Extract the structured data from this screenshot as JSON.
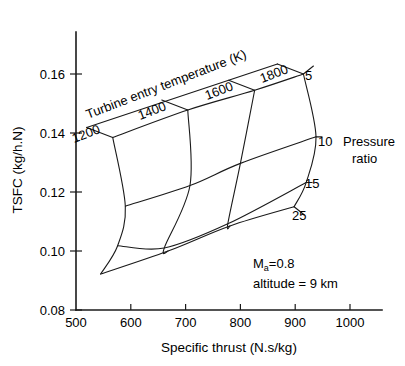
{
  "chart_data": {
    "type": "line",
    "title": "",
    "subtitle": "",
    "xlabel": "Specific thrust (N.s/kg)",
    "ylabel": "TSFC (kg/h.N)",
    "xlim": [
      500,
      1000
    ],
    "ylim": [
      0.08,
      0.16
    ],
    "xticks": [
      500,
      600,
      700,
      800,
      900,
      1000
    ],
    "xticklabels": [
      "500",
      "600",
      "700",
      "800",
      "900",
      "1000"
    ],
    "yticks": [
      0.08,
      0.1,
      0.12,
      0.14,
      0.16
    ],
    "yticklabels": [
      "0.08",
      "0.10",
      "0.12",
      "0.14",
      "0.16"
    ],
    "grid": false,
    "legend_position": "right",
    "carpet": {
      "param_u_name": "Turbine entry temperature (K)",
      "param_u_values": [
        1200,
        1400,
        1600,
        1800
      ],
      "param_u_labels": [
        "1200",
        "1400",
        "1600",
        "1800"
      ],
      "param_v_name": "Pressure ratio",
      "param_v_values": [
        5,
        10,
        15,
        25
      ],
      "param_v_labels": [
        "5",
        "10",
        "15",
        "25"
      ],
      "points": [
        {
          "tet": 1200,
          "pr": 5,
          "x": 567,
          "y": 0.1385
        },
        {
          "tet": 1400,
          "pr": 5,
          "x": 704,
          "y": 0.1478
        },
        {
          "tet": 1600,
          "pr": 5,
          "x": 826,
          "y": 0.1545
        },
        {
          "tet": 1800,
          "pr": 5,
          "x": 915,
          "y": 0.16
        },
        {
          "tet": 1200,
          "pr": 10,
          "x": 590,
          "y": 0.1152
        },
        {
          "tet": 1400,
          "pr": 10,
          "x": 708,
          "y": 0.1222
        },
        {
          "tet": 1600,
          "pr": 10,
          "x": 800,
          "y": 0.1297
        },
        {
          "tet": 1800,
          "pr": 10,
          "x": 938,
          "y": 0.1387
        },
        {
          "tet": 1200,
          "pr": 15,
          "x": 576,
          "y": 0.1018
        },
        {
          "tet": 1400,
          "pr": 15,
          "x": 661,
          "y": 0.101
        },
        {
          "tet": 1600,
          "pr": 15,
          "x": 777,
          "y": 0.1092
        },
        {
          "tet": 1800,
          "pr": 15,
          "x": 920,
          "y": 0.1232
        },
        {
          "tet": 1200,
          "pr": 25,
          "x": 545,
          "y": 0.0922
        },
        {
          "tet": 1400,
          "pr": 25,
          "x": 668,
          "y": 0.1
        },
        {
          "tet": 1600,
          "pr": 25,
          "x": 781,
          "y": 0.1085
        },
        {
          "tet": 1800,
          "pr": 25,
          "x": 898,
          "y": 0.115
        }
      ]
    },
    "annotations": [
      {
        "id": "mach",
        "text": "M",
        "sub": "a",
        "tail": "=0.8",
        "x": 795,
        "y": 0.0953
      },
      {
        "id": "altitude",
        "text": "altitude = 9 km",
        "x": 795,
        "y": 0.089
      }
    ]
  },
  "labels": {
    "tet_title": "Turbine entry temperature (K)",
    "pressure_ratio_line1": "Pressure",
    "pressure_ratio_line2": "ratio",
    "tet_1200": "1200",
    "tet_1400": "1400",
    "tet_1600": "1600",
    "tet_1800": "1800",
    "pr_5": "5",
    "pr_10": "10",
    "pr_15": "15",
    "pr_25": "25",
    "mach_symbol": "M",
    "mach_subscript": "a",
    "mach_value": "=0.8",
    "altitude": "altitude = 9 km",
    "x_axis_title": "Specific thrust (N.s/kg)",
    "y_axis_title": "TSFC (kg/h.N)",
    "xtick_500": "500",
    "xtick_600": "600",
    "xtick_700": "700",
    "xtick_800": "800",
    "xtick_900": "900",
    "xtick_1000": "1000",
    "ytick_008": "0.08",
    "ytick_010": "0.10",
    "ytick_012": "0.12",
    "ytick_014": "0.14",
    "ytick_016": "0.16"
  },
  "colors": {
    "ink": "#1a1a1a",
    "background": "#ffffff"
  }
}
